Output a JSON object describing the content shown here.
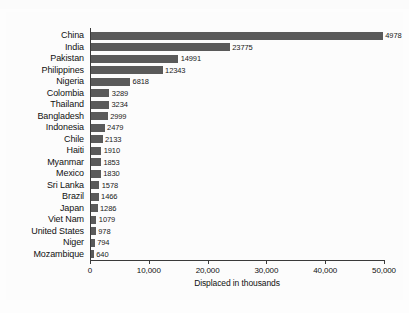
{
  "figure": {
    "top_artifact_text": "",
    "bar_color": "#5a5a5a",
    "axis_color": "#3a3a3a",
    "background_color": "#fdfdfd"
  },
  "chart_data": {
    "type": "bar",
    "orientation": "horizontal",
    "title": "",
    "xlabel": "Displaced in thousands",
    "ylabel": "",
    "xlim": [
      0,
      50000
    ],
    "grid": false,
    "legend": null,
    "xticks": [
      0,
      10000,
      20000,
      30000,
      40000,
      50000
    ],
    "xticklabels": [
      "0",
      "10,000",
      "20,000",
      "30,000",
      "40,000",
      "50,000"
    ],
    "categories": [
      "China",
      "India",
      "Pakistan",
      "Philippines",
      "Nigeria",
      "Colombia",
      "Thailand",
      "Bangladesh",
      "Indonesia",
      "Chile",
      "Haiti",
      "Myanmar",
      "Mexico",
      "Sri Lanka",
      "Brazil",
      "Japan",
      "Viet Nam",
      "United States",
      "Niger",
      "Mozambique"
    ],
    "values": [
      49785,
      23775,
      14991,
      12343,
      6818,
      3289,
      3234,
      2999,
      2479,
      2133,
      1910,
      1853,
      1830,
      1578,
      1466,
      1286,
      1079,
      978,
      794,
      640
    ],
    "value_labels": [
      "4978",
      "23775",
      "14991",
      "12343",
      "6818",
      "3289",
      "3234",
      "2999",
      "2479",
      "2133",
      "1910",
      "1853",
      "1830",
      "1578",
      "1466",
      "1286",
      "1079",
      "978",
      "794",
      "640"
    ]
  }
}
